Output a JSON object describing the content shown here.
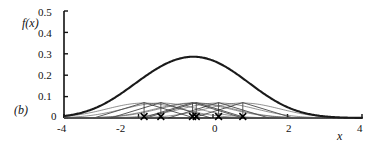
{
  "panel": {
    "label": "(b)"
  },
  "axes": {
    "ylabel": "f(x)",
    "xlabel": "x",
    "yticks": [
      "0.5",
      "0.4",
      "0.3",
      "0.2",
      "0.1",
      "0"
    ],
    "ytick_values": [
      0.5,
      0.4,
      0.3,
      0.2,
      0.1,
      0
    ],
    "xticks": [
      "-4",
      "-2",
      "0",
      "2",
      "4"
    ],
    "xtick_values": [
      -4,
      -2,
      0,
      2,
      4
    ],
    "xlim": [
      -4,
      4
    ],
    "ylim": [
      0,
      0.5
    ]
  },
  "colors": {
    "axis": "#111111",
    "density_curve": "#1a1a1a",
    "kernel_curve": "#555555",
    "tent_line": "#222222",
    "marker": "#000000"
  },
  "chart_data": {
    "type": "line",
    "title": "",
    "xlabel": "x",
    "ylabel": "f(x)",
    "xlim": [
      -4,
      4
    ],
    "ylim": [
      0,
      0.5
    ],
    "grid": false,
    "legend": "none",
    "data_points": [
      -1.85,
      -1.4,
      -0.55,
      -0.45,
      0.15,
      0.8
    ],
    "n_points": 6,
    "bandwidth": 1.0,
    "kernel_peak_height": 0.07,
    "series": [
      {
        "name": "kernel density estimate (sum)",
        "style": "thick",
        "x": [
          -4,
          -3.6,
          -3.2,
          -2.8,
          -2.4,
          -2,
          -1.6,
          -1.2,
          -0.8,
          -0.4,
          0,
          0.4,
          0.8,
          1.2,
          1.6,
          2,
          2.4,
          2.8,
          3.2,
          3.6,
          4
        ],
        "values": [
          0.004,
          0.008,
          0.017,
          0.033,
          0.06,
          0.098,
          0.148,
          0.205,
          0.263,
          0.31,
          0.327,
          0.312,
          0.268,
          0.208,
          0.147,
          0.095,
          0.056,
          0.03,
          0.015,
          0.006,
          0.003
        ]
      },
      {
        "name": "kernel component at -1.85",
        "style": "thin",
        "center": -1.85,
        "peak": 0.07
      },
      {
        "name": "kernel component at -1.4",
        "style": "thin",
        "center": -1.4,
        "peak": 0.07
      },
      {
        "name": "kernel component at -0.55",
        "style": "thin",
        "center": -0.55,
        "peak": 0.07
      },
      {
        "name": "kernel component at -0.45",
        "style": "thin",
        "center": -0.45,
        "peak": 0.07
      },
      {
        "name": "kernel component at 0.15",
        "style": "thin",
        "center": 0.15,
        "peak": 0.07
      },
      {
        "name": "kernel component at 0.8",
        "style": "thin",
        "center": 0.8,
        "peak": 0.07
      }
    ],
    "tent_kernels": [
      {
        "center": -1.85,
        "halfwidth": 1.35,
        "peak": 0.072
      },
      {
        "center": -1.4,
        "halfwidth": 1.35,
        "peak": 0.072
      },
      {
        "center": -0.55,
        "halfwidth": 1.35,
        "peak": 0.072
      },
      {
        "center": -0.45,
        "halfwidth": 1.35,
        "peak": 0.072
      },
      {
        "center": 0.15,
        "halfwidth": 1.35,
        "peak": 0.072
      },
      {
        "center": 0.8,
        "halfwidth": 1.35,
        "peak": 0.072
      }
    ]
  }
}
